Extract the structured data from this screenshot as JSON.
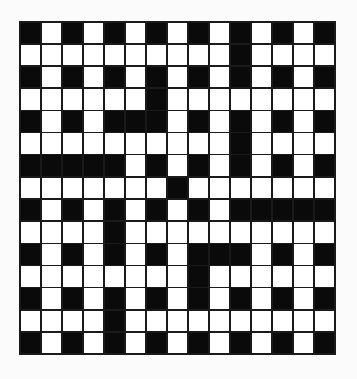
{
  "puzzle": {
    "type": "crossword",
    "rows": 15,
    "cols": 15,
    "colors": {
      "block": "#0a0a0a",
      "open": "#ffffff",
      "gridline": "#1a1a1a",
      "background": "#fbfbfb"
    },
    "legend": {
      "B": "black-square",
      "W": "white-square"
    },
    "grid": [
      "BWBWBWBWBWBWBWB",
      "WWWWWWWWWWBWWWW",
      "BWBWBWBWBWBWBWB",
      "WWWWWWBWWWWWWWW",
      "BWBWBBBWBWBWBWB",
      "WWWWWWWWWWBWWWW",
      "BBBBBWBWBWBWBWB",
      "WWWWWWWBWWWWWWW",
      "BWBWBWBWBWBBBBB",
      "WWWWBWWWWWWWWWW",
      "BWBWBWBWBBBWBWB",
      "WWWWWWWWBWWWWWW",
      "BWBWBWBWBWBWBWB",
      "WWWWBWWWWWWWWWW",
      "BWBWBWBWBWBWBWB"
    ]
  }
}
